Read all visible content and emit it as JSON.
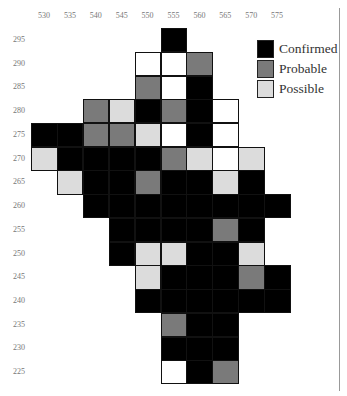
{
  "chart_data": {
    "type": "heatmap",
    "title": "",
    "xlabel": "",
    "ylabel": "",
    "x": [
      530,
      535,
      540,
      545,
      550,
      555,
      560,
      565,
      570,
      575
    ],
    "y": [
      295,
      290,
      285,
      280,
      275,
      270,
      265,
      260,
      255,
      250,
      245,
      240,
      235,
      230,
      225
    ],
    "categories_legend": [
      "Confirmed",
      "Probable",
      "Possible"
    ],
    "value_key": {
      "C": "Confirmed",
      "P": "Probable",
      "S": "Possible",
      "W": "Surveyed (none)",
      "": "Outside"
    },
    "grid": [
      [
        "",
        "",
        "",
        "",
        "",
        "C",
        "",
        "",
        "",
        ""
      ],
      [
        "",
        "",
        "",
        "",
        "W",
        "W",
        "P",
        "",
        "",
        ""
      ],
      [
        "",
        "",
        "",
        "",
        "P",
        "W",
        "C",
        "",
        "",
        ""
      ],
      [
        "",
        "",
        "P",
        "S",
        "C",
        "P",
        "C",
        "W",
        "",
        ""
      ],
      [
        "C",
        "C",
        "P",
        "P",
        "S",
        "W",
        "C",
        "W",
        "",
        ""
      ],
      [
        "S",
        "C",
        "C",
        "C",
        "C",
        "P",
        "S",
        "W",
        "S",
        ""
      ],
      [
        "",
        "S",
        "C",
        "C",
        "P",
        "C",
        "C",
        "S",
        "C",
        ""
      ],
      [
        "",
        "",
        "C",
        "C",
        "C",
        "C",
        "C",
        "C",
        "C",
        "C"
      ],
      [
        "",
        "",
        "",
        "C",
        "C",
        "C",
        "C",
        "P",
        "C",
        ""
      ],
      [
        "",
        "",
        "",
        "C",
        "S",
        "S",
        "C",
        "C",
        "S",
        ""
      ],
      [
        "",
        "",
        "",
        "",
        "S",
        "C",
        "C",
        "C",
        "P",
        "C"
      ],
      [
        "",
        "",
        "",
        "",
        "C",
        "C",
        "C",
        "C",
        "C",
        "C"
      ],
      [
        "",
        "",
        "",
        "",
        "",
        "P",
        "C",
        "C",
        "",
        ""
      ],
      [
        "",
        "",
        "",
        "",
        "",
        "C",
        "C",
        "C",
        "",
        ""
      ],
      [
        "",
        "",
        "",
        "",
        "",
        "W",
        "C",
        "P",
        "",
        ""
      ]
    ],
    "colors": {
      "Confirmed": "#000000",
      "Probable": "#7a7a7a",
      "Possible": "#dcdcdc",
      "None": "#ffffff"
    },
    "legend_position": "top-right",
    "grid_lines": false
  },
  "legend": {
    "items": [
      {
        "label": "Confirmed",
        "color": "#000000"
      },
      {
        "label": "Probable",
        "color": "#7a7a7a"
      },
      {
        "label": "Possible",
        "color": "#dcdcdc"
      }
    ]
  }
}
